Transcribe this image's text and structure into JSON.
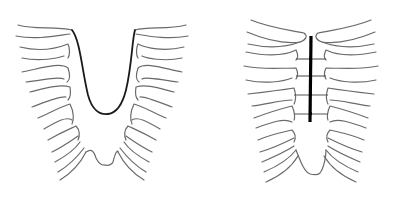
{
  "figures": [
    {
      "id": "left",
      "label": "Sternal cleft / defect (before repair)",
      "elements": [
        "rib-cage-outline",
        "upper-U-shaped-defect-edge",
        "lower-xiphoid-notch"
      ]
    },
    {
      "id": "right",
      "label": "After repair with sternal bar and sutures",
      "elements": [
        "rib-cage-outline",
        "vertical-sternal-bar",
        "horizontal-sutures"
      ],
      "suture_count": 4
    }
  ],
  "colors": {
    "background": "#ffffff",
    "rib_line": "#6a6a6a",
    "defect_line": "#1a1a1a",
    "bar": "#000000"
  }
}
